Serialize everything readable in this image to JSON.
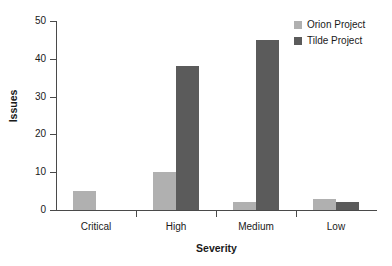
{
  "chart_data": {
    "type": "bar",
    "title": "",
    "subtitle": "",
    "xlabel": "Severity",
    "ylabel": "Issues",
    "categories": [
      "Critical",
      "High",
      "Medium",
      "Low"
    ],
    "series": [
      {
        "name": "Orion Project",
        "color": "#b0b0b0",
        "values": [
          5,
          10,
          2,
          3
        ]
      },
      {
        "name": "Tilde Project",
        "color": "#5b5b5b",
        "values": [
          0,
          38,
          45,
          2
        ]
      }
    ],
    "ylim": [
      0,
      50
    ],
    "yticks": [
      0,
      10,
      20,
      30,
      40,
      50
    ],
    "ytick_labels": [
      "0",
      "10",
      "20",
      "30",
      "40",
      "50"
    ],
    "grid": false,
    "legend_position": "top-right",
    "background": "#ffffff",
    "axis_color": "#4a4a4a",
    "text_color": "#1a1a1a",
    "annotations": []
  },
  "legend": {
    "entries": [
      {
        "label": "Orion Project",
        "color": "#b0b0b0"
      },
      {
        "label": "Tilde Project",
        "color": "#5b5b5b"
      }
    ]
  }
}
